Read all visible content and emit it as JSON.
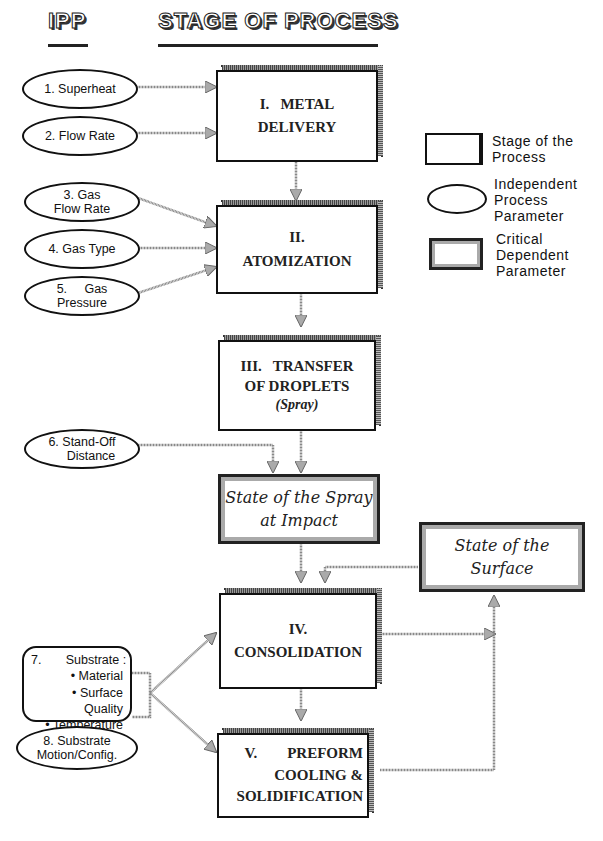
{
  "headers": {
    "ipp": "IPP",
    "stage": "STAGE OF PROCESS"
  },
  "stages": [
    {
      "id": "metal-delivery",
      "lines": [
        "I.   METAL",
        "DELIVERY"
      ]
    },
    {
      "id": "atomization",
      "lines": [
        "II.",
        "ATOMIZATION"
      ]
    },
    {
      "id": "transfer",
      "lines": [
        "III.   TRANSFER",
        "OF DROPLETS"
      ],
      "sub": "(Spray)"
    },
    {
      "id": "consolidation",
      "lines": [
        "IV.",
        "CONSOLIDATION"
      ]
    },
    {
      "id": "preform",
      "lines": [
        "V.        PREFORM",
        "COOLING &",
        "SOLIDIFICATION"
      ]
    }
  ],
  "critical": [
    {
      "id": "spray-impact",
      "lines": [
        "State of the Spray",
        "at Impact"
      ]
    },
    {
      "id": "surface",
      "lines": [
        "State of the",
        "Surface"
      ]
    }
  ],
  "parameters": [
    {
      "id": "superheat",
      "lines": [
        "1.  Superheat"
      ]
    },
    {
      "id": "flow-rate",
      "lines": [
        "2.  Flow Rate"
      ]
    },
    {
      "id": "gas-flow-rate",
      "lines": [
        "3.  Gas",
        "Flow Rate"
      ]
    },
    {
      "id": "gas-type",
      "lines": [
        "4.  Gas Type"
      ]
    },
    {
      "id": "gas-pressure",
      "lines": [
        "5.     Gas",
        "Pressure"
      ]
    },
    {
      "id": "stand-off",
      "lines": [
        "6.  Stand-Off",
        "Distance"
      ]
    },
    {
      "id": "substrate",
      "lines": [
        "7.       Substrate :",
        "• Material",
        "• Surface Quality",
        "• Temperature"
      ]
    },
    {
      "id": "substrate-motion",
      "lines": [
        "8.  Substrate",
        "Motion/Config."
      ]
    }
  ],
  "legend": [
    {
      "shape": "stage-box",
      "text": [
        "Stage of the",
        "Process"
      ]
    },
    {
      "shape": "ellipse",
      "text": [
        "Independent",
        "Process",
        "Parameter"
      ]
    },
    {
      "shape": "critical-box",
      "text": [
        "Critical",
        "Dependent",
        "Parameter"
      ]
    }
  ]
}
